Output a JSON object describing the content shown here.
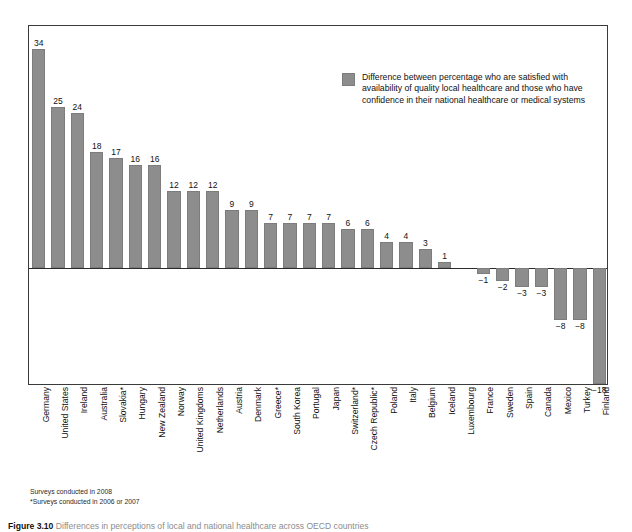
{
  "chart_data": {
    "type": "bar",
    "title": "",
    "xlabel": "",
    "ylabel": "",
    "ylim": [
      -18,
      34
    ],
    "grid": false,
    "legend_position": "top-right",
    "legend": [
      "Difference between percentage who are satisfied with availability of quality local healthcare and those who have confidence in their national healthcare or medical systems"
    ],
    "categories": [
      "Germany",
      "United States",
      "Ireland",
      "Australia",
      "Slovakia*",
      "Hungary",
      "New Zealand",
      "Norway",
      "United Kingdoms",
      "Netherlands",
      "Austria",
      "Denmark",
      "Greece*",
      "South Korea",
      "Portugal",
      "Japan",
      "Switzerland*",
      "Czech Republic*",
      "Poland",
      "Italy",
      "Belgium",
      "Iceland",
      "Luxembourg",
      "France",
      "Sweden",
      "Spain",
      "Canada",
      "Mexico",
      "Turkey",
      "Finland"
    ],
    "values": [
      34,
      25,
      24,
      18,
      17,
      16,
      16,
      12,
      12,
      12,
      9,
      9,
      7,
      7,
      7,
      7,
      6,
      6,
      4,
      4,
      3,
      1,
      0,
      -1,
      -2,
      -3,
      -3,
      -8,
      -8,
      -18
    ],
    "value_labels": [
      "34",
      "25",
      "24",
      "18",
      "17",
      "16",
      "16",
      "12",
      "12",
      "12",
      "9",
      "9",
      "7",
      "7",
      "7",
      "7",
      "6",
      "6",
      "4",
      "4",
      "3",
      "1",
      "",
      "−1",
      "−2",
      "−3",
      "−3",
      "−8",
      "−8",
      "−18"
    ],
    "bar_color": "#8d8d8d"
  },
  "legend": {
    "swatch_name": "legend-color-swatch",
    "text": "Difference between percentage who are satisfied with availability of quality local healthcare and those who have confidence in their national healthcare or medical systems"
  },
  "footnotes": {
    "line1": "Surveys conducted in 2008",
    "line2": "*Surveys conducted in 2006 or 2007"
  },
  "caption": {
    "label": "Figure 3.10",
    "text": "Differences in perceptions of local and national healthcare across OECD countries"
  }
}
